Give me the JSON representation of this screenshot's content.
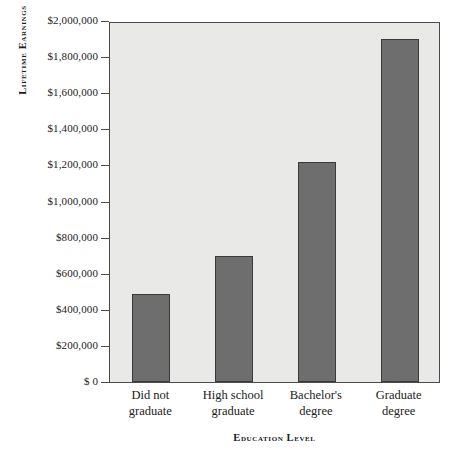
{
  "chart_data": {
    "type": "bar",
    "title": "",
    "xlabel": "Education Level",
    "ylabel": "Lifetime Earnings",
    "categories": [
      "Did not graduate",
      "High school graduate",
      "Bachelor's degree",
      "Graduate degree"
    ],
    "category_lines": [
      [
        "Did not",
        "graduate"
      ],
      [
        "High school",
        "graduate"
      ],
      [
        "Bachelor's",
        "degree"
      ],
      [
        "Graduate",
        "degree"
      ]
    ],
    "values": [
      490000,
      700000,
      1220000,
      1900000
    ],
    "ylim": [
      0,
      2000000
    ],
    "ytick_values": [
      0,
      200000,
      400000,
      600000,
      800000,
      1000000,
      1200000,
      1400000,
      1600000,
      1800000,
      2000000
    ],
    "ytick_labels": [
      "$ 0",
      "$200,000",
      "$400,000",
      "$600,000",
      "$800,000",
      "$1,000,000",
      "$1,200,000",
      "$1,400,000",
      "$1,600,000",
      "$1,800,000",
      "$2,000,000"
    ],
    "grid": false,
    "legend": false,
    "bar_color": "#6e6e6e",
    "bar_edge_color": "#3a3a3a",
    "plot_background": "#e9e9e7",
    "axis_color": "#4a4a4a",
    "page_background": "#ffffff"
  }
}
